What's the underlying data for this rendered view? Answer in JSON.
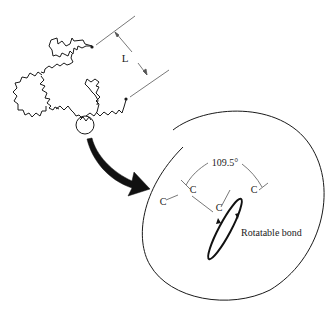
{
  "diagram": {
    "dimension_label": "L",
    "angle_label": "109.5°",
    "atoms": [
      "C",
      "C",
      "C",
      "C"
    ],
    "bond_label": "Rotatable bond",
    "colors": {
      "stroke": "#1a1a1a",
      "dimension_stroke": "#555555",
      "background": "#ffffff"
    }
  }
}
